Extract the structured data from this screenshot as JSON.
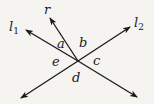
{
  "diagram": {
    "lines": [
      {
        "id": "l1",
        "label": "l",
        "subscript": "1"
      },
      {
        "id": "l2",
        "label": "l",
        "subscript": "2"
      }
    ],
    "ray": {
      "id": "r",
      "label": "r"
    },
    "angles": {
      "a": "a",
      "b": "b",
      "c": "c",
      "d": "d",
      "e": "e"
    },
    "colors": {
      "stroke": "#1a1a1a",
      "background": "#f5f4f1"
    }
  }
}
